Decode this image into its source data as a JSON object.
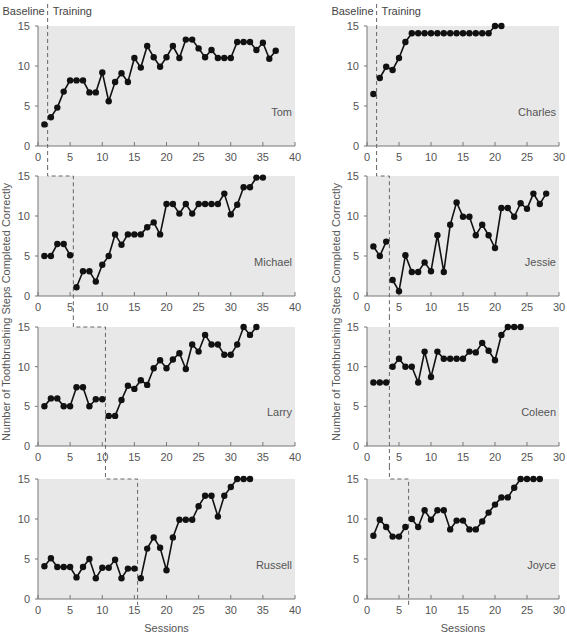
{
  "chart_data": {
    "type": "line",
    "title": "",
    "xlabel": "Sessions",
    "ylabel": "Number of Toothbrushing Steps Completed Correctly",
    "phase_labels": {
      "baseline": "Baseline",
      "training": "Training"
    },
    "colors": {
      "plot_bg": "#e8e8e8",
      "line": "#111111",
      "marker": "#111111",
      "axis": "#777777",
      "text": "#555555",
      "phase_line": "#666666"
    },
    "columns": [
      {
        "xlim": [
          0,
          40
        ],
        "xticks": [
          0,
          5,
          10,
          15,
          20,
          25,
          30,
          35,
          40
        ],
        "panels": [
          {
            "name": "Tom",
            "ylim": [
              0,
              15
            ],
            "yticks": [
              0,
              5,
              10,
              15
            ],
            "phase_change": 1.5,
            "x": [
              1,
              2,
              3,
              4,
              5,
              6,
              7,
              8,
              9,
              10,
              11,
              12,
              13,
              14,
              15,
              16,
              17,
              18,
              19,
              20,
              21,
              22,
              23,
              24,
              25,
              26,
              27,
              28,
              29,
              30,
              31,
              32,
              33,
              34,
              35,
              36,
              37
            ],
            "values": [
              2.7,
              3.6,
              4.8,
              6.8,
              8.2,
              8.2,
              8.2,
              6.7,
              6.7,
              9.2,
              5.6,
              8,
              9.1,
              8,
              11,
              9.8,
              12.5,
              11.1,
              9.9,
              11.1,
              12.5,
              11,
              13.3,
              13.3,
              12.2,
              11.1,
              12,
              11,
              11,
              11,
              13,
              13,
              13,
              12,
              12.9,
              10.9,
              11.9
            ]
          },
          {
            "name": "Michael",
            "ylim": [
              0,
              15
            ],
            "yticks": [
              0,
              5,
              10,
              15
            ],
            "phase_change": 5.5,
            "x": [
              1,
              2,
              3,
              4,
              5,
              6,
              7,
              8,
              9,
              10,
              11,
              12,
              13,
              14,
              15,
              16,
              17,
              18,
              19,
              20,
              21,
              22,
              23,
              24,
              25,
              26,
              27,
              28,
              29,
              30,
              31,
              32,
              33,
              34,
              35
            ],
            "values": [
              5,
              5,
              6.5,
              6.5,
              5.1,
              1.1,
              3.1,
              3.1,
              1.8,
              3.9,
              5,
              7.7,
              6.4,
              7.7,
              7.7,
              7.7,
              8.6,
              9.2,
              7.7,
              11.5,
              11.5,
              10.3,
              11.5,
              10.3,
              11.5,
              11.5,
              11.5,
              11.5,
              12.8,
              10.2,
              11.4,
              13.6,
              13.6,
              14.8,
              14.8
            ]
          },
          {
            "name": "Larry",
            "ylim": [
              0,
              15
            ],
            "yticks": [
              0,
              5,
              10,
              15
            ],
            "phase_change": 10.5,
            "x": [
              1,
              2,
              3,
              4,
              5,
              6,
              7,
              8,
              9,
              10,
              11,
              12,
              13,
              14,
              15,
              16,
              17,
              18,
              19,
              20,
              21,
              22,
              23,
              24,
              25,
              26,
              27,
              28,
              29,
              30,
              31,
              32,
              33,
              34
            ],
            "values": [
              5,
              6,
              6,
              5,
              5,
              7.4,
              7.4,
              5,
              5.9,
              5.9,
              3.8,
              3.8,
              5.8,
              7.6,
              7.2,
              8.3,
              7.7,
              9.8,
              10.8,
              9.8,
              10.9,
              11.7,
              9.7,
              12.8,
              11.9,
              14,
              12.8,
              12.8,
              11.5,
              11.5,
              12.8,
              15,
              14,
              15
            ]
          },
          {
            "name": "Russell",
            "ylim": [
              0,
              15
            ],
            "yticks": [
              0,
              5,
              10,
              15
            ],
            "phase_change": 15.5,
            "x": [
              1,
              2,
              3,
              4,
              5,
              6,
              7,
              8,
              9,
              10,
              11,
              12,
              13,
              14,
              15,
              16,
              17,
              18,
              19,
              20,
              21,
              22,
              23,
              24,
              25,
              26,
              27,
              28,
              29,
              30,
              31,
              32,
              33
            ],
            "values": [
              4.1,
              5.1,
              4,
              4,
              4,
              2.7,
              4,
              5,
              2.6,
              3.9,
              3.9,
              4.9,
              2.6,
              3.8,
              3.8,
              2.6,
              6.3,
              7.7,
              6.4,
              3.6,
              7.7,
              9.9,
              9.9,
              9.9,
              11.6,
              12.9,
              12.9,
              10.3,
              12.9,
              14,
              15,
              15,
              15
            ]
          }
        ]
      },
      {
        "xlim": [
          0,
          30
        ],
        "xticks": [
          0,
          5,
          10,
          15,
          20,
          25,
          30
        ],
        "panels": [
          {
            "name": "Charles",
            "ylim": [
              0,
              15
            ],
            "yticks": [
              0,
              5,
              10,
              15
            ],
            "phase_change": 1.5,
            "x": [
              1,
              2,
              3,
              4,
              5,
              6,
              7,
              8,
              9,
              10,
              11,
              12,
              13,
              14,
              15,
              16,
              17,
              18,
              19,
              20,
              21
            ],
            "values": [
              6.5,
              8.5,
              9.9,
              9.5,
              11,
              13,
              14.1,
              14.1,
              14.1,
              14.1,
              14.1,
              14.1,
              14.1,
              14.1,
              14.1,
              14.1,
              14.1,
              14.1,
              14.1,
              15,
              15
            ]
          },
          {
            "name": "Jessie",
            "ylim": [
              0,
              15
            ],
            "yticks": [
              0,
              5,
              10,
              15
            ],
            "phase_change": 3.5,
            "x": [
              1,
              2,
              3,
              4,
              5,
              6,
              7,
              8,
              9,
              10,
              11,
              12,
              13,
              14,
              15,
              16,
              17,
              18,
              19,
              20,
              21,
              22,
              23,
              24,
              25,
              26,
              27,
              28
            ],
            "values": [
              6.2,
              5,
              6.8,
              2,
              0.6,
              5.1,
              3,
              3,
              4.2,
              3.1,
              7.6,
              3,
              8.9,
              11.7,
              9.9,
              9.9,
              7.6,
              8.9,
              7.6,
              6,
              11,
              11,
              9.9,
              11.6,
              10.9,
              12.8,
              11.5,
              12.8
            ]
          },
          {
            "name": "Coleen",
            "ylim": [
              0,
              15
            ],
            "yticks": [
              0,
              5,
              10,
              15
            ],
            "phase_change": 3.5,
            "x": [
              1,
              2,
              3,
              4,
              5,
              6,
              7,
              8,
              9,
              10,
              11,
              12,
              13,
              14,
              15,
              16,
              17,
              18,
              19,
              20,
              21,
              22,
              23,
              24
            ],
            "values": [
              8,
              8,
              8,
              10,
              11,
              10,
              10,
              8,
              11.9,
              8.7,
              11.9,
              11,
              11,
              11,
              11,
              11.9,
              11.8,
              13,
              12,
              10.8,
              14,
              15,
              15,
              15
            ]
          },
          {
            "name": "Joyce",
            "ylim": [
              0,
              15
            ],
            "yticks": [
              0,
              5,
              10,
              15
            ],
            "phase_change": 6.5,
            "x": [
              1,
              2,
              3,
              4,
              5,
              6,
              7,
              8,
              9,
              10,
              11,
              12,
              13,
              14,
              15,
              16,
              17,
              18,
              19,
              20,
              21,
              22,
              23,
              24,
              25,
              26,
              27
            ],
            "values": [
              7.9,
              9.9,
              9,
              7.8,
              7.8,
              9,
              10,
              9,
              11.1,
              9.9,
              11.1,
              11.1,
              8.7,
              9.8,
              9.8,
              8.7,
              8.7,
              9.7,
              10.8,
              11.8,
              12.7,
              12.7,
              13.9,
              15,
              15,
              15,
              15
            ]
          }
        ]
      }
    ]
  }
}
